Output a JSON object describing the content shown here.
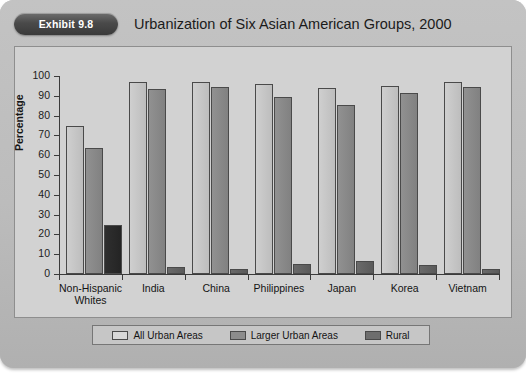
{
  "header": {
    "exhibit_label": "Exhibit 9.8",
    "title": "Urbanization of Six Asian American Groups, 2000"
  },
  "colors": {
    "all_urban_areas": "#cfcfcf",
    "larger_urban_areas": "#8c8c8c",
    "rural": "#5f5f5f",
    "rural_first_group": "#2a2a2a",
    "panel_background": "#d2d2d2",
    "figure_background": "#bcbcbc",
    "axis": "#3b3b3b"
  },
  "chart_data": {
    "type": "bar",
    "title": "Urbanization of Six Asian American Groups, 2000",
    "xlabel": "",
    "ylabel": "Percentage",
    "ylim": [
      0,
      100
    ],
    "yticks": [
      0,
      10,
      20,
      30,
      40,
      50,
      60,
      70,
      80,
      90,
      100
    ],
    "grid": false,
    "legend_position": "bottom",
    "categories": [
      "Non-Hispanic Whites",
      "India",
      "China",
      "Philippines",
      "Japan",
      "Korea",
      "Vietnam"
    ],
    "category_lines": [
      [
        "Non-Hispanic",
        "Whites"
      ],
      [
        "India"
      ],
      [
        "China"
      ],
      [
        "Philippines"
      ],
      [
        "Japan"
      ],
      [
        "Korea"
      ],
      [
        "Vietnam"
      ]
    ],
    "series": [
      {
        "name": "All Urban Areas",
        "values": [
          75,
          97,
          97,
          96,
          94,
          95,
          97
        ]
      },
      {
        "name": "Larger Urban Areas",
        "values": [
          63.5,
          93.5,
          94.5,
          89.5,
          85.5,
          91.5,
          94.5
        ]
      },
      {
        "name": "Rural",
        "values": [
          25,
          3.5,
          2.5,
          5,
          6.5,
          4.5,
          2.5
        ]
      }
    ]
  },
  "legend": {
    "items": [
      {
        "label": "All Urban Areas"
      },
      {
        "label": "Larger Urban Areas"
      },
      {
        "label": "Rural"
      }
    ]
  }
}
